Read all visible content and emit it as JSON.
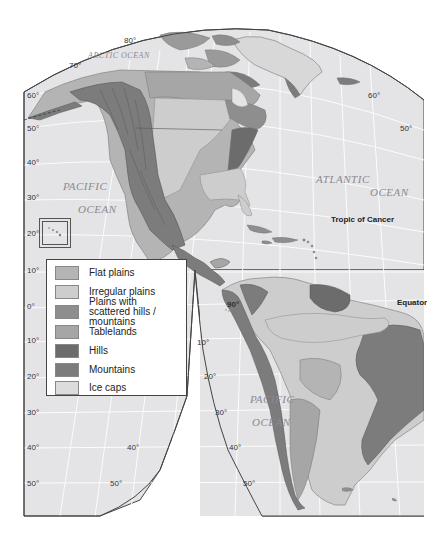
{
  "map": {
    "title": "Landforms of the Americas",
    "colors": {
      "ocean": "#e4e4e6",
      "graticule": "#ffffff",
      "border": "#444444",
      "flat_plains": "#b4b4b4",
      "irregular_plains": "#cdcdcd",
      "plains_scattered": "#8e8e8e",
      "tablelands": "#a6a6a6",
      "hills": "#6c6c6c",
      "mountains": "#7c7c7c",
      "ice_caps": "#dcdcdc"
    },
    "oceans": [
      {
        "id": "arctic",
        "label": "ARCTIC OCEAN"
      },
      {
        "id": "pacific_north_1",
        "label": "PACIFIC"
      },
      {
        "id": "pacific_north_2",
        "label": "OCEAN"
      },
      {
        "id": "atlantic_1",
        "label": "ATLANTIC"
      },
      {
        "id": "atlantic_2",
        "label": "OCEAN"
      },
      {
        "id": "pacific_south_1",
        "label": "PACIFIC"
      },
      {
        "id": "pacific_south_2",
        "label": "OCEAN"
      }
    ],
    "annotations": {
      "tropic_of_cancer": "Tropic of Cancer",
      "equator": "Equator"
    },
    "lat_labels_left": [
      "60°",
      "50°",
      "40°",
      "30°",
      "20°",
      "10°",
      "0°",
      "10°",
      "20°",
      "30°",
      "40°",
      "50°"
    ],
    "lat_labels_inner": {
      "north_top": [
        "80°",
        "70°"
      ],
      "right": [
        "60°",
        "50°"
      ],
      "south_center": [
        "10°",
        "20°",
        "30°",
        "40°",
        "50°"
      ],
      "south_left_inner": [
        "40°",
        "50°"
      ],
      "meridian": "90°"
    }
  },
  "legend": {
    "items": [
      {
        "label": "Flat plains",
        "color": "#b4b4b4"
      },
      {
        "label": "Irregular plains",
        "color": "#cdcdcd"
      },
      {
        "label": "Plains with scattered hills / mountains",
        "color": "#8e8e8e"
      },
      {
        "label": "Tablelands",
        "color": "#a6a6a6"
      },
      {
        "label": "Hills",
        "color": "#6c6c6c"
      },
      {
        "label": "Mountains",
        "color": "#7c7c7c"
      },
      {
        "label": "Ice caps",
        "color": "#dcdcdc"
      }
    ]
  }
}
